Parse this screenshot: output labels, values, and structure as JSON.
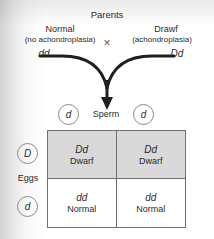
{
  "diagram": {
    "parents_title": "Parents",
    "cross_symbol": "×",
    "parent_left": {
      "name": "Normal",
      "condition": "(no achondroplasia)",
      "genotype": "dd"
    },
    "parent_right": {
      "name": "Drawf",
      "condition": "(achondroplasia)",
      "genotype": "Dd"
    },
    "sperm": {
      "label": "Sperm",
      "alleles": [
        "d",
        "d"
      ]
    },
    "eggs": {
      "label": "Eggs",
      "alleles": [
        "D",
        "d"
      ]
    },
    "punnett": {
      "cells": [
        {
          "genotype": "Dd",
          "phenotype": "Dwarf",
          "shaded": true
        },
        {
          "genotype": "Dd",
          "phenotype": "Dwarf",
          "shaded": true
        },
        {
          "genotype": "dd",
          "phenotype": "Normal",
          "shaded": false
        },
        {
          "genotype": "dd",
          "phenotype": "Normal",
          "shaded": false
        }
      ]
    },
    "colors": {
      "shaded_cell": "#d9d9d9",
      "grid_line": "#6f6f6f",
      "circle_line": "#8a8a8a",
      "text": "#2b2b2b"
    }
  }
}
